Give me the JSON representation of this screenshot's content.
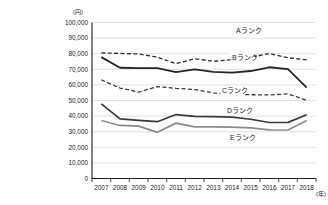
{
  "chart_data": {
    "type": "line",
    "title": "",
    "xlabel": "(年)",
    "ylabel": "(円)",
    "x": [
      2007,
      2008,
      2009,
      2010,
      2011,
      2012,
      2013,
      2014,
      2015,
      2016,
      2017,
      2018
    ],
    "categories": [
      "2007",
      "2008",
      "2009",
      "2010",
      "2011",
      "2012",
      "2013",
      "2014",
      "2015",
      "2016",
      "2017",
      "2018"
    ],
    "ylim": [
      0,
      100000
    ],
    "yticks": [
      0,
      10000,
      20000,
      30000,
      40000,
      50000,
      60000,
      70000,
      80000,
      90000,
      100000
    ],
    "ytick_labels": [
      "0",
      "10,000",
      "20,000",
      "30,000",
      "40,000",
      "50,000",
      "60,000",
      "70,000",
      "80,000",
      "90,000",
      "100,000"
    ],
    "grid": true,
    "legend": "inline-labels",
    "series": [
      {
        "name": "Aランク",
        "label": "Aランク",
        "style": "dashed",
        "color": "#2b2b2b",
        "width": 1.3,
        "values": [
          80500,
          80200,
          79800,
          77800,
          73600,
          76800,
          75100,
          76200,
          77600,
          80100,
          77400,
          76000
        ]
      },
      {
        "name": "Bランク",
        "label": "Bランク",
        "style": "solid",
        "color": "#262626",
        "width": 1.8,
        "values": [
          77800,
          71000,
          70800,
          70700,
          68200,
          69900,
          68300,
          67900,
          68900,
          71300,
          70100,
          58200
        ]
      },
      {
        "name": "Cランク",
        "label": "Cランク",
        "style": "dashed",
        "color": "#3a3a3a",
        "width": 1.3,
        "values": [
          63200,
          58000,
          55400,
          58900,
          57800,
          57000,
          54900,
          54100,
          53700,
          53600,
          54200,
          50100
        ]
      },
      {
        "name": "Dランク",
        "label": "Dランク",
        "style": "solid",
        "color": "#3a3a3a",
        "width": 1.7,
        "values": [
          47800,
          38200,
          37300,
          36400,
          41000,
          39800,
          39700,
          39400,
          38000,
          35900,
          36000,
          40900
        ]
      },
      {
        "name": "Eランク",
        "label": "Eランク",
        "style": "solid",
        "color": "#8c8c8c",
        "width": 1.7,
        "values": [
          37200,
          34000,
          33600,
          29600,
          35500,
          33100,
          33100,
          32900,
          32500,
          31200,
          31100,
          37200
        ]
      }
    ],
    "series_label_positions": [
      {
        "name": "Aランク",
        "x": 236,
        "y": 33
      },
      {
        "name": "Bランク",
        "x": 232,
        "y": 60
      },
      {
        "name": "Cランク",
        "x": 222,
        "y": 93
      },
      {
        "name": "Dランク",
        "x": 227,
        "y": 113
      },
      {
        "name": "Eランク",
        "x": 230,
        "y": 140
      }
    ]
  }
}
